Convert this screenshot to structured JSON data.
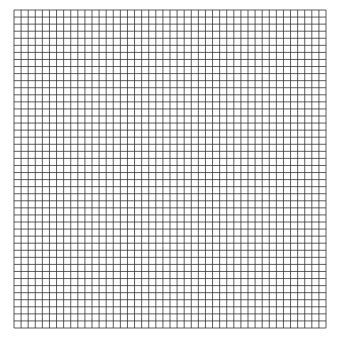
{
  "grid": {
    "left": 14,
    "top": 10,
    "right": 326,
    "bottom": 328,
    "cols": 44,
    "rows": 45,
    "line_color": "#333333",
    "background": "#ffffff"
  }
}
